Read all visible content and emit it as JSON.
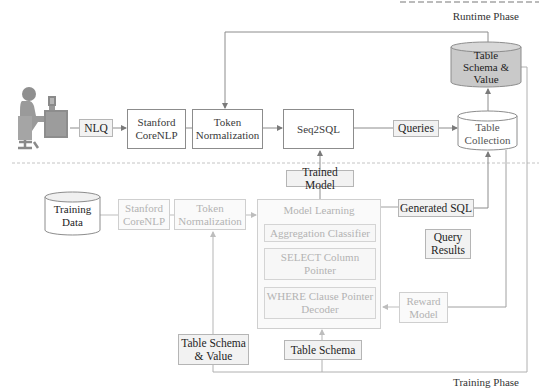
{
  "phases": {
    "runtime": "Runtime Phase",
    "training": "Training Phase"
  },
  "runtime": {
    "user_icon": "person-at-computer-icon",
    "nlq": "NLQ",
    "stanford_corenlp": [
      "Stanford",
      "CoreNLP"
    ],
    "token_normalization": [
      "Token",
      "Normalization"
    ],
    "seq2sql": "Seq2SQL",
    "queries": "Queries",
    "table_collection": [
      "Table",
      "Collection"
    ],
    "table_schema_value": [
      "Table",
      "Schema &",
      "Value"
    ]
  },
  "training": {
    "trained_model": "Trained Model",
    "training_data": [
      "Training",
      "Data"
    ],
    "stanford_corenlp": [
      "Stanford",
      "CoreNLP"
    ],
    "token_normalization": [
      "Token",
      "Normalization"
    ],
    "model_learning": {
      "title": "Model Learning",
      "components": [
        "Aggregation Classifier",
        [
          "SELECT Column",
          "Pointer"
        ],
        [
          "WHERE Clause Pointer",
          "Decoder"
        ]
      ]
    },
    "generated_sql": "Generated SQL",
    "query_results": [
      "Query",
      "Results"
    ],
    "reward_model": [
      "Reward",
      "Model"
    ],
    "table_schema_value": [
      "Table Schema",
      "& Value"
    ],
    "table_schema": "Table Schema"
  },
  "colors": {
    "line": "#8c8c8c",
    "faded_line": "#c8c8c8",
    "label_bg": "#f2f2f2",
    "cylinder_fill_grey": "#c9c9c9",
    "dashed_divider": "#bdbdbd"
  }
}
